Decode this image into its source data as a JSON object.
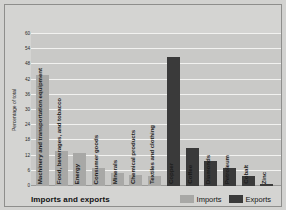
{
  "chart_data": {
    "type": "bar",
    "title": "",
    "xlabel": "Imports and exports",
    "ylabel": "Percentage of total",
    "ylim": [
      0,
      60
    ],
    "ytick_step": 6,
    "yticks": [
      0,
      6,
      12,
      18,
      24,
      30,
      36,
      42,
      48,
      54,
      60
    ],
    "grid": true,
    "legend_position": "bottom-right",
    "legend": [
      "Imports",
      "Exports"
    ],
    "categories": [
      "Machinery and transportation equipment",
      "Food, beverages, and tobacco",
      "Energy",
      "Consumer goods",
      "Minerals",
      "Chemical products",
      "Textiles and clothing",
      "Copper",
      "Coffee",
      "Diamonds",
      "Petroleum",
      "Cobalt",
      "Zinc"
    ],
    "series": [
      {
        "name": "Imports",
        "color": "#a8a8a6",
        "values": [
          44,
          14,
          13,
          7,
          5,
          4.5,
          4,
          null,
          null,
          null,
          null,
          null,
          null
        ]
      },
      {
        "name": "Exports",
        "color": "#3a3a3a",
        "values": [
          null,
          null,
          null,
          null,
          null,
          null,
          null,
          51,
          15,
          10,
          7,
          4,
          0.6
        ]
      }
    ],
    "bars": [
      {
        "label": "Machinery and transportation equipment",
        "value": 44,
        "series": "Imports"
      },
      {
        "label": "Food, beverages, and tobacco",
        "value": 14,
        "series": "Imports"
      },
      {
        "label": "Energy",
        "value": 13,
        "series": "Imports"
      },
      {
        "label": "Consumer goods",
        "value": 7,
        "series": "Imports"
      },
      {
        "label": "Minerals",
        "value": 5,
        "series": "Imports"
      },
      {
        "label": "Chemical products",
        "value": 4.5,
        "series": "Imports"
      },
      {
        "label": "Textiles and clothing",
        "value": 4,
        "series": "Imports"
      },
      {
        "label": "Copper",
        "value": 51,
        "series": "Exports"
      },
      {
        "label": "Coffee",
        "value": 15,
        "series": "Exports"
      },
      {
        "label": "Diamonds",
        "value": 10,
        "series": "Exports"
      },
      {
        "label": "Petroleum",
        "value": 7,
        "series": "Exports"
      },
      {
        "label": "Cobalt",
        "value": 4,
        "series": "Exports"
      },
      {
        "label": "Zinc",
        "value": 0.6,
        "series": "Exports"
      }
    ]
  },
  "axis": {
    "y_title": "Percentage of total",
    "x_title": "Imports and exports"
  },
  "legend": {
    "imports_label": "Imports",
    "exports_label": "Exports"
  },
  "colors": {
    "imports": "#a8a8a6",
    "exports": "#3a3a3a",
    "plot_background": "#c9c9c7",
    "gridline": "#f2f2f0",
    "page_background": "#d4d4d2"
  }
}
